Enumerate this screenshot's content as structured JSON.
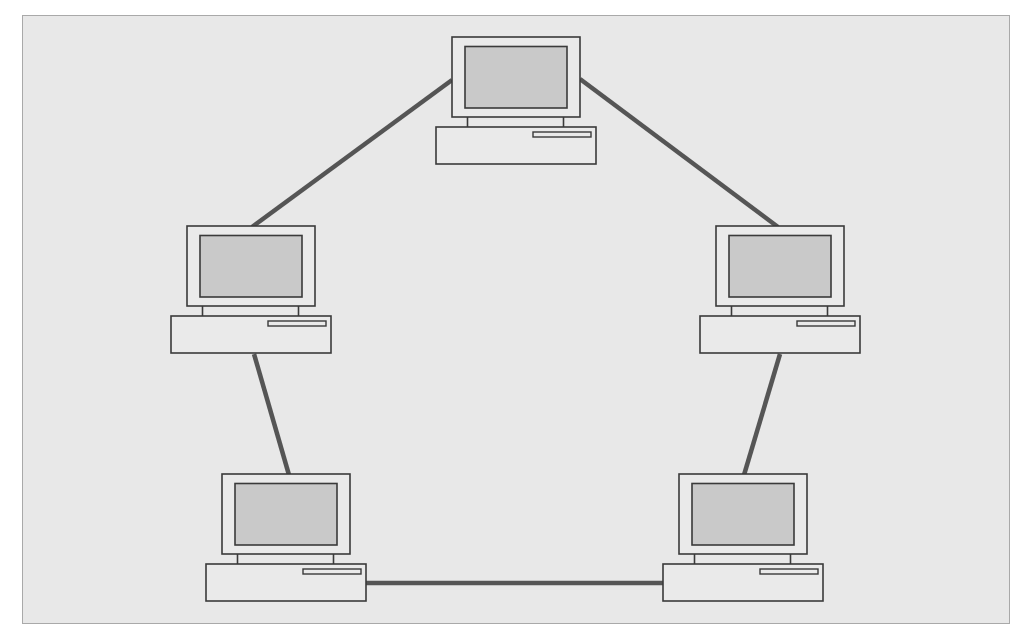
{
  "diagram": {
    "type": "ring-network-topology",
    "canvas": {
      "width": 1026,
      "height": 638,
      "background": "#ffffff"
    },
    "frame": {
      "x": 22,
      "y": 15,
      "width": 988,
      "height": 609,
      "fill": "#e8e8e8",
      "border": "#a9a9a9"
    },
    "colors": {
      "link": "#555555",
      "outline": "#3a3a3a",
      "monitor_body": "#eaeaea",
      "screen": "#c9c9c9"
    },
    "nodes": [
      {
        "id": "computer-top",
        "icon": "desktop-computer-icon",
        "x": 436,
        "y": 37
      },
      {
        "id": "computer-middle-left",
        "icon": "desktop-computer-icon",
        "x": 171,
        "y": 226
      },
      {
        "id": "computer-middle-right",
        "icon": "desktop-computer-icon",
        "x": 700,
        "y": 226
      },
      {
        "id": "computer-bottom-left",
        "icon": "desktop-computer-icon",
        "x": 206,
        "y": 474
      },
      {
        "id": "computer-bottom-right",
        "icon": "desktop-computer-icon",
        "x": 663,
        "y": 474
      }
    ],
    "links": [
      {
        "id": "link-top-to-middle-left",
        "from": "computer-top",
        "to": "computer-middle-left",
        "x1": 452,
        "y1": 80,
        "x2": 252,
        "y2": 227
      },
      {
        "id": "link-top-to-middle-right",
        "from": "computer-top",
        "to": "computer-middle-right",
        "x1": 580,
        "y1": 79,
        "x2": 778,
        "y2": 227
      },
      {
        "id": "link-middle-left-to-bottom-left",
        "from": "computer-middle-left",
        "to": "computer-bottom-left",
        "x1": 254,
        "y1": 354,
        "x2": 289,
        "y2": 475
      },
      {
        "id": "link-middle-right-to-bottom-right",
        "from": "computer-middle-right",
        "to": "computer-bottom-right",
        "x1": 780,
        "y1": 354,
        "x2": 744,
        "y2": 475
      },
      {
        "id": "link-bottom-left-to-bottom-right",
        "from": "computer-bottom-left",
        "to": "computer-bottom-right",
        "x1": 366,
        "y1": 583,
        "x2": 664,
        "y2": 583
      }
    ]
  }
}
